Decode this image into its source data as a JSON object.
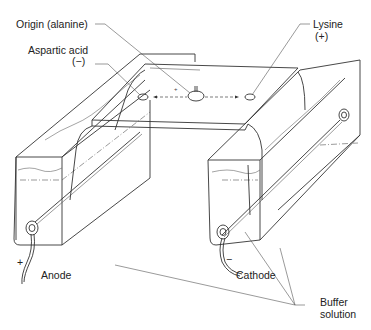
{
  "diagram": {
    "type": "paper electrophoresis apparatus",
    "labels": {
      "origin": "Origin (alanine)",
      "aspartic_acid": "Aspartic acid",
      "aspartic_charge": "(−)",
      "lysine": "Lysine",
      "lysine_charge": "(+)",
      "anode": "Anode",
      "anode_sign": "+",
      "cathode": "Cathode",
      "cathode_sign": "−",
      "buffer_line1": "Buffer",
      "buffer_line2": "solution"
    },
    "spots": [
      {
        "name": "aspartic-acid-spot",
        "direction": "left"
      },
      {
        "name": "origin-alanine-spot",
        "direction": "none"
      },
      {
        "name": "lysine-spot",
        "direction": "right"
      }
    ],
    "colors": {
      "line": "#333333",
      "background": "#ffffff"
    }
  }
}
